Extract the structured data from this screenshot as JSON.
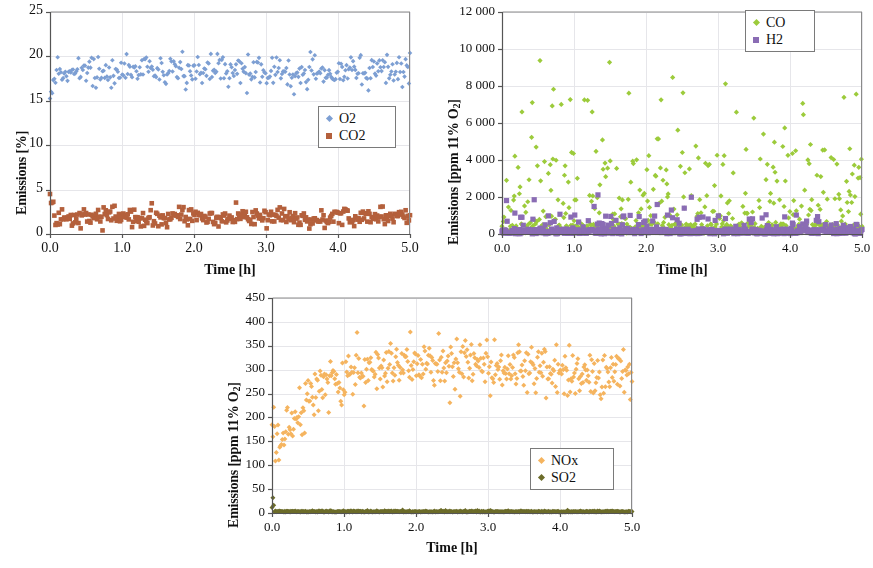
{
  "figure": {
    "background": "#ffffff",
    "panels": [
      "o2_co2",
      "co_h2",
      "nox_so2"
    ]
  },
  "chart_data": [
    {
      "id": "o2_co2",
      "type": "scatter",
      "title": "",
      "xlabel": "Time [h]",
      "ylabel": "Emissions [%]",
      "ylabel_html": "Emissions [%]",
      "xlim": [
        0,
        5
      ],
      "ylim": [
        0,
        25
      ],
      "xticks": [
        "0.0",
        "1.0",
        "2.0",
        "3.0",
        "4.0",
        "5.0"
      ],
      "xtickvals": [
        0,
        1,
        2,
        3,
        4,
        5
      ],
      "yticks": [
        "0",
        "5",
        "10",
        "15",
        "20",
        "25"
      ],
      "ytickvals": [
        0,
        5,
        10,
        15,
        20,
        25
      ],
      "grid": true,
      "legend_position": "center-right",
      "series": [
        {
          "name": "O2",
          "color": "#7d9fd3",
          "marker": "diamond",
          "mean": 18.4,
          "noise": 0.95,
          "n": 330,
          "profile": "flat-with-startup-dip"
        },
        {
          "name": "CO2",
          "color": "#b4603c",
          "marker": "square",
          "mean": 1.9,
          "noise": 0.55,
          "n": 330,
          "profile": "flat-with-startup-spike"
        }
      ]
    },
    {
      "id": "co_h2",
      "type": "scatter",
      "title": "",
      "xlabel": "Time [h]",
      "ylabel": "Emissions [ppm 11% O2]",
      "ylabel_html": "Emissions [ppm 11% O<sub>2</sub>]",
      "xlim": [
        0,
        5
      ],
      "ylim": [
        0,
        12000
      ],
      "xticks": [
        "0.0",
        "1.0",
        "2.0",
        "3.0",
        "4.0",
        "5.0"
      ],
      "xtickvals": [
        0,
        1,
        2,
        3,
        4,
        5
      ],
      "yticks": [
        "0",
        "2 000",
        "4 000",
        "6 000",
        "8 000",
        "10 000",
        "12 000"
      ],
      "ytickvals": [
        0,
        2000,
        4000,
        6000,
        8000,
        10000,
        12000
      ],
      "grid": true,
      "legend_position": "top-right",
      "series": [
        {
          "name": "CO",
          "color": "#9ccb3b",
          "marker": "diamond",
          "median": 900,
          "max": 9600,
          "n": 560,
          "profile": "highly-scattered-spiky"
        },
        {
          "name": "H2",
          "color": "#8a6cb4",
          "marker": "square",
          "median": 200,
          "max": 4000,
          "n": 560,
          "profile": "low-baseline-occasional-spikes"
        }
      ]
    },
    {
      "id": "nox_so2",
      "type": "scatter",
      "title": "",
      "xlabel": "Time [h]",
      "ylabel": "Emissions [ppm 11% O2]",
      "ylabel_html": "Emissions [ppm 11% O<sub>2</sub>]",
      "xlim": [
        0,
        5
      ],
      "ylim": [
        0,
        450
      ],
      "xticks": [
        "0.0",
        "1.0",
        "2.0",
        "3.0",
        "4.0",
        "5.0"
      ],
      "xtickvals": [
        0,
        1,
        2,
        3,
        4,
        5
      ],
      "yticks": [
        "0",
        "50",
        "100",
        "150",
        "200",
        "250",
        "300",
        "350",
        "400",
        "450"
      ],
      "ytickvals": [
        0,
        50,
        100,
        150,
        200,
        250,
        300,
        350,
        400,
        450
      ],
      "grid": true,
      "legend_position": "lower-right",
      "series": [
        {
          "name": "NOx",
          "color": "#f5b45f",
          "marker": "diamond",
          "start": 100,
          "plateau": 290,
          "peak": 385,
          "noise": 30,
          "n": 420,
          "profile": "rise-then-plateau"
        },
        {
          "name": "SO2",
          "color": "#6c6c2a",
          "marker": "diamond",
          "mean": 2,
          "noise": 2,
          "n": 420,
          "profile": "flat-near-zero"
        }
      ]
    }
  ]
}
